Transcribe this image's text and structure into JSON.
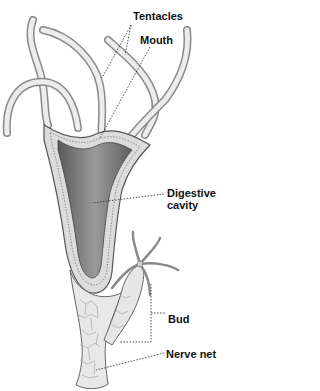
{
  "diagram": {
    "labels": {
      "tentacles": "Tentacles",
      "mouth": "Mouth",
      "digestive_cavity_line1": "Digestive",
      "digestive_cavity_line2": "cavity",
      "bud": "Bud",
      "nerve_net": "Nerve net"
    },
    "colors": {
      "background": "#ffffff",
      "text": "#111111",
      "body_outline": "#555555",
      "body_fill": "#e6e6e6",
      "cavity_fill": "#7a7a7a",
      "leader_line": "#222222"
    }
  }
}
